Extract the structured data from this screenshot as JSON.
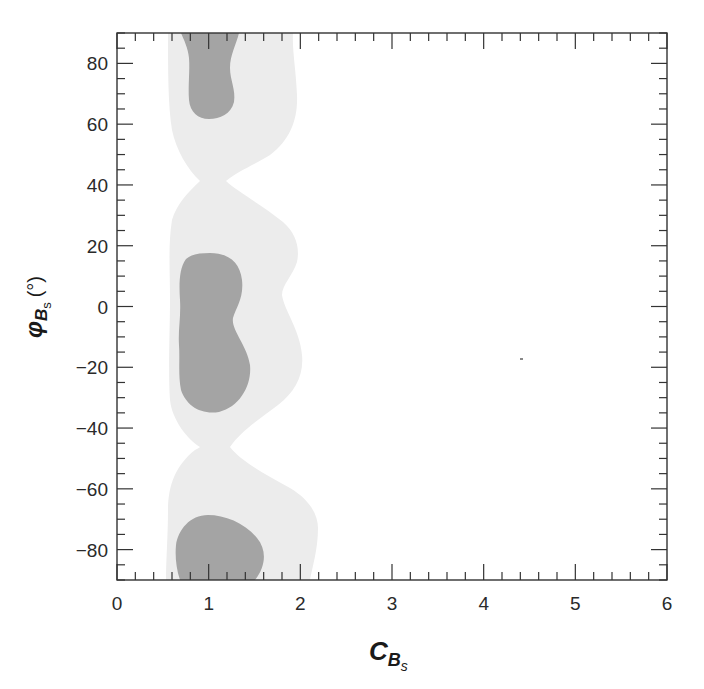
{
  "chart_data": {
    "type": "heatmap",
    "subtype": "contour (confidence regions)",
    "title": "",
    "xlabel": "C_{B_s}",
    "xlabel_main": "C",
    "xlabel_sub": "B",
    "xlabel_subsub": "s",
    "ylabel": "φ_{B_s} (°)",
    "ylabel_main": "φ",
    "ylabel_sub": "B",
    "ylabel_subsub": "s",
    "ylabel_unit": "(°)",
    "xlim": [
      0,
      6
    ],
    "ylim": [
      -90,
      90
    ],
    "xticks": [
      "0",
      "1",
      "2",
      "3",
      "4",
      "5",
      "6"
    ],
    "yticks": [
      "80",
      "60",
      "40",
      "20",
      "0",
      "−20",
      "−40",
      "−60",
      "−80"
    ],
    "grid": false,
    "legend": "none",
    "colors": {
      "inner_region": "#a4a4a4",
      "outer_region": "#ececec",
      "frame": "#333333"
    },
    "regions": [
      {
        "level": "outer (light)",
        "description": "Lighter confidence band spanning C≈0.55–2.2, pinched near φ≈+40° and φ≈−47°",
        "lobes": [
          {
            "phi_range": [
              42,
              90
            ],
            "C_range": [
              0.55,
              1.95
            ]
          },
          {
            "phi_range": [
              -47,
              40
            ],
            "C_range": [
              0.57,
              2.0
            ]
          },
          {
            "phi_range": [
              -90,
              -49
            ],
            "C_range": [
              0.53,
              2.2
            ]
          }
        ]
      },
      {
        "level": "inner (dark)",
        "description": "Darker confidence islands centred at C≈1",
        "lobes": [
          {
            "phi_range": [
              62,
              90
            ],
            "C_range": [
              0.7,
              1.33
            ],
            "center": [
              1.0,
              78
            ]
          },
          {
            "phi_range": [
              -35,
              24
            ],
            "C_range": [
              0.68,
              1.4
            ],
            "center": [
              1.0,
              -5
            ]
          },
          {
            "phi_range": [
              -90,
              -58
            ],
            "C_range": [
              0.63,
              1.6
            ],
            "center": [
              1.05,
              -77
            ]
          }
        ]
      }
    ],
    "annotations": [
      {
        "type": "speck",
        "x": 4.4,
        "y": -18
      }
    ]
  }
}
